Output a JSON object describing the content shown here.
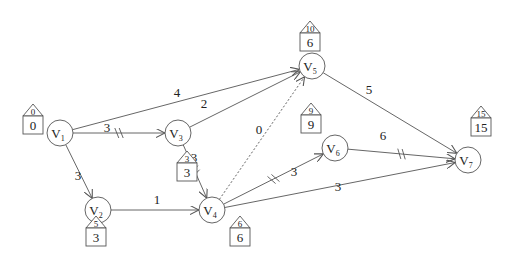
{
  "diagram": {
    "type": "activity-on-arc network (critical path)",
    "colors": {
      "stroke": "#555555",
      "text": "#222222",
      "background": "#ffffff"
    },
    "nodes": [
      {
        "id": "V1",
        "label": "V",
        "sub": "1",
        "x": 60,
        "y": 133,
        "top": "0",
        "bottom": "0",
        "box_x": 33,
        "box_y": 116
      },
      {
        "id": "V2",
        "label": "V",
        "sub": "2",
        "x": 98,
        "y": 210,
        "top": "5",
        "bottom": "3",
        "box_x": 96,
        "box_y": 228
      },
      {
        "id": "V3",
        "label": "V",
        "sub": "3",
        "x": 178,
        "y": 133,
        "top": "3",
        "bottom": "3",
        "box_x": 187,
        "box_y": 163
      },
      {
        "id": "V4",
        "label": "V",
        "sub": "4",
        "x": 212,
        "y": 210,
        "top": "6",
        "bottom": "6",
        "box_x": 240,
        "box_y": 228
      },
      {
        "id": "V5",
        "label": "V",
        "sub": "5",
        "x": 312,
        "y": 66,
        "top": "10",
        "bottom": "6",
        "box_x": 310,
        "box_y": 33
      },
      {
        "id": "V6",
        "label": "V",
        "sub": "6",
        "x": 335,
        "y": 148,
        "top": "9",
        "bottom": "9",
        "box_x": 311,
        "box_y": 115
      },
      {
        "id": "V7",
        "label": "V",
        "sub": "7",
        "x": 468,
        "y": 160,
        "top": "15",
        "bottom": "15",
        "box_x": 481,
        "box_y": 118
      }
    ],
    "edges": [
      {
        "from": "V1",
        "to": "V5",
        "weight": "4",
        "lx": 177,
        "ly": 97,
        "critical": false,
        "dashed": false
      },
      {
        "from": "V1",
        "to": "V3",
        "weight": "3",
        "lx": 107,
        "ly": 132,
        "critical": true,
        "dashed": false
      },
      {
        "from": "V1",
        "to": "V2",
        "weight": "3",
        "lx": 78,
        "ly": 180,
        "critical": false,
        "dashed": false
      },
      {
        "from": "V3",
        "to": "V5",
        "weight": "2",
        "lx": 204,
        "ly": 108,
        "critical": false,
        "dashed": false
      },
      {
        "from": "V3",
        "to": "V4",
        "weight": "3",
        "lx": 194,
        "ly": 162,
        "critical": true,
        "dashed": false
      },
      {
        "from": "V2",
        "to": "V4",
        "weight": "1",
        "lx": 157,
        "ly": 204,
        "critical": false,
        "dashed": false
      },
      {
        "from": "V4",
        "to": "V5",
        "weight": "0",
        "lx": 259,
        "ly": 134,
        "critical": false,
        "dashed": true
      },
      {
        "from": "V4",
        "to": "V6",
        "weight": "3",
        "lx": 294,
        "ly": 176,
        "critical": true,
        "dashed": false
      },
      {
        "from": "V4",
        "to": "V7",
        "weight": "3",
        "lx": 338,
        "ly": 191,
        "critical": false,
        "dashed": false
      },
      {
        "from": "V5",
        "to": "V7",
        "weight": "5",
        "lx": 369,
        "ly": 94,
        "critical": false,
        "dashed": false
      },
      {
        "from": "V6",
        "to": "V7",
        "weight": "6",
        "lx": 383,
        "ly": 140,
        "critical": true,
        "dashed": false
      }
    ]
  }
}
